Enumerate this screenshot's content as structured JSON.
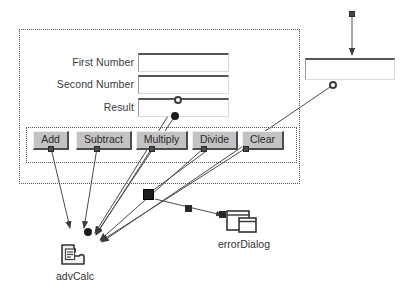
{
  "canvas": {
    "width": 408,
    "height": 303,
    "background": "#ffffff",
    "line_color": "#4a4a4a",
    "panel_border_color": "#555555",
    "button_face": "#c3c3c3"
  },
  "form_panel": {
    "name": "advanced-calculator-form",
    "fields": [
      {
        "label": "First Number",
        "value": "",
        "placeholder": ""
      },
      {
        "label": "Second Number",
        "value": "",
        "placeholder": ""
      },
      {
        "label": "Result",
        "value": "",
        "placeholder": ""
      }
    ],
    "button_panel": {
      "buttons": [
        {
          "label": "Add"
        },
        {
          "label": "Subtract"
        },
        {
          "label": "Multiply"
        },
        {
          "label": "Divide"
        },
        {
          "label": "Clear"
        }
      ]
    }
  },
  "detached_field": {
    "name": "error-message-field",
    "value": "",
    "placeholder": ""
  },
  "nodes": [
    {
      "id": "advCalc",
      "label": "advCalc",
      "icon": "bean-component-icon"
    },
    {
      "id": "errorDialog",
      "label": "errorDialog",
      "icon": "dialog-window-icon"
    }
  ]
}
